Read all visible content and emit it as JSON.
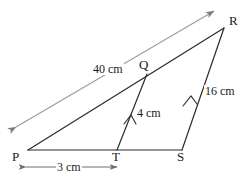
{
  "figure": {
    "type": "geometry-diagram",
    "background_color": "#ffffff",
    "line_color": "#2b2b2b",
    "dim_line_color": "#8a8a8a"
  },
  "vertices": [
    {
      "id": "P",
      "label": "P",
      "x": 28,
      "y": 150,
      "label_x": 12,
      "label_y": 151
    },
    {
      "id": "T",
      "label": "T",
      "x": 117,
      "y": 150,
      "label_x": 113,
      "label_y": 151
    },
    {
      "id": "S",
      "label": "S",
      "x": 182,
      "y": 150,
      "label_x": 178,
      "label_y": 151
    },
    {
      "id": "Q",
      "label": "Q",
      "x": 147,
      "y": 74,
      "label_x": 139,
      "label_y": 60
    },
    {
      "id": "R",
      "label": "R",
      "x": 224,
      "y": 28,
      "label_x": 229,
      "label_y": 15
    }
  ],
  "segments": [
    {
      "from": "P",
      "to": "R",
      "name": "segment-pr"
    },
    {
      "from": "P",
      "to": "S",
      "name": "segment-ps"
    },
    {
      "from": "S",
      "to": "R",
      "name": "segment-sr"
    },
    {
      "from": "Q",
      "to": "T",
      "name": "segment-qt"
    }
  ],
  "measurements": [
    {
      "id": "pr",
      "label": "40 cm",
      "value": 40,
      "unit": "cm",
      "applies_to": "P-R",
      "label_x": 93,
      "label_y": 64,
      "style": "double-arrow-offset"
    },
    {
      "id": "qt",
      "label": "4 cm",
      "value": 4,
      "unit": "cm",
      "applies_to": "Q-T",
      "label_x": 136,
      "label_y": 107,
      "style": "tick-arrow"
    },
    {
      "id": "sr",
      "label": "16 cm",
      "value": 16,
      "unit": "cm",
      "applies_to": "S-R",
      "label_x": 205,
      "label_y": 86,
      "style": "tick-arrow"
    },
    {
      "id": "pt",
      "label": "3 cm",
      "value": 3,
      "unit": "cm",
      "applies_to": "P-T",
      "label_x": 56,
      "label_y": 161,
      "style": "dimension-line"
    }
  ]
}
